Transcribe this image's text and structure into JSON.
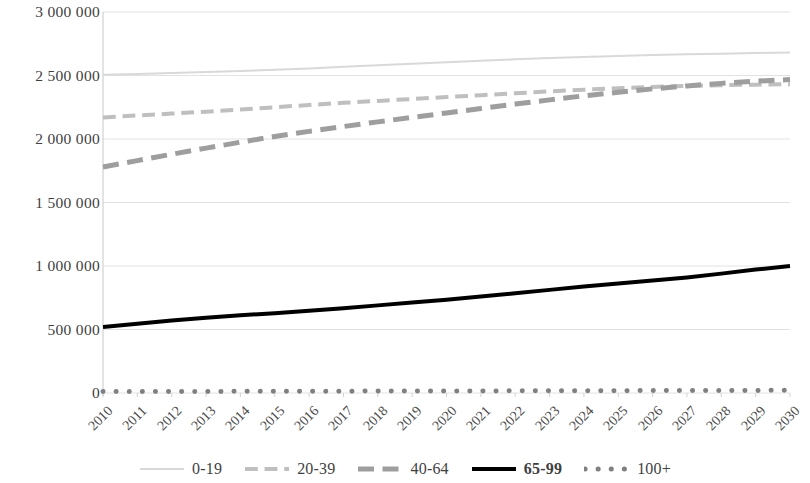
{
  "chart_data": {
    "type": "line",
    "title": "",
    "xlabel": "",
    "ylabel": "",
    "categories": [
      "2010",
      "2011",
      "2012",
      "2013",
      "2014",
      "2015",
      "2016",
      "2017",
      "2018",
      "2019",
      "2020",
      "2021",
      "2022",
      "2023",
      "2024",
      "2025",
      "2026",
      "2027",
      "2028",
      "2029",
      "2030"
    ],
    "ylim": [
      0,
      3000000
    ],
    "ytick_labels": [
      "3 000 000",
      "2 500 000",
      "2 000 000",
      "1 500 000",
      "1 000 000",
      "500 000",
      "0"
    ],
    "ytick_values": [
      3000000,
      2500000,
      2000000,
      1500000,
      1000000,
      500000,
      0
    ],
    "grid": true,
    "legend_position": "bottom",
    "series": [
      {
        "name": "0-19",
        "color": "#d9d9d9",
        "style": "solid",
        "width": 2,
        "values": [
          2505000,
          2512000,
          2520000,
          2528000,
          2536000,
          2545000,
          2556000,
          2568000,
          2580000,
          2592000,
          2604000,
          2616000,
          2627000,
          2637000,
          2646000,
          2654000,
          2661000,
          2667000,
          2672000,
          2677000,
          2682000
        ]
      },
      {
        "name": "20-39",
        "color": "#bfbfbf",
        "style": "dashed",
        "width": 4,
        "values": [
          2170000,
          2185000,
          2200000,
          2215000,
          2232000,
          2250000,
          2268000,
          2285000,
          2300000,
          2315000,
          2330000,
          2345000,
          2360000,
          2375000,
          2388000,
          2400000,
          2410000,
          2418000,
          2424000,
          2428000,
          2432000
        ]
      },
      {
        "name": "40-64",
        "color": "#9e9e9e",
        "style": "dashed",
        "width": 5,
        "values": [
          1780000,
          1830000,
          1880000,
          1928000,
          1975000,
          2020000,
          2060000,
          2098000,
          2135000,
          2170000,
          2205000,
          2240000,
          2275000,
          2308000,
          2340000,
          2368000,
          2395000,
          2418000,
          2438000,
          2455000,
          2468000
        ]
      },
      {
        "name": "65-99",
        "color": "#000000",
        "style": "solid",
        "width": 4,
        "values": [
          520000,
          545000,
          570000,
          592000,
          612000,
          628000,
          648000,
          668000,
          690000,
          712000,
          735000,
          760000,
          785000,
          812000,
          838000,
          862000,
          885000,
          910000,
          940000,
          972000,
          1000000
        ]
      },
      {
        "name": "100+",
        "color": "#808080",
        "style": "dotted",
        "width": 5,
        "values": [
          11000,
          11500,
          12000,
          12500,
          13000,
          13500,
          14000,
          14500,
          15000,
          15500,
          16000,
          16500,
          17000,
          17500,
          18000,
          18500,
          19000,
          19500,
          20000,
          20500,
          21000
        ]
      }
    ]
  },
  "legend": {
    "items": [
      {
        "label": "0-19"
      },
      {
        "label": "20-39"
      },
      {
        "label": "40-64"
      },
      {
        "label": "65-99"
      },
      {
        "label": "100+"
      }
    ]
  }
}
